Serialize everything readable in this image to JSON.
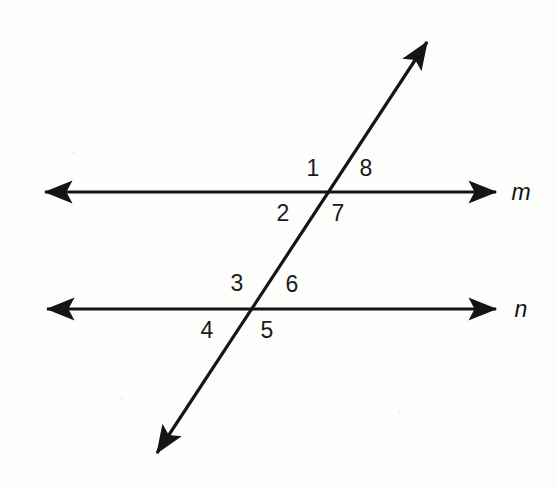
{
  "canvas": {
    "width": 556,
    "height": 491,
    "background_color": "#fdfdfc",
    "stroke_color": "#151515"
  },
  "diagram": {
    "type": "parallel-lines-cut-by-transversal",
    "lines": [
      {
        "name": "line-m",
        "label": "m",
        "orientation": "horizontal",
        "double_arrow": true,
        "x1": 35,
        "y1": 192,
        "x2": 505,
        "y2": 192,
        "label_x": 521,
        "label_y": 192
      },
      {
        "name": "line-n",
        "label": "n",
        "orientation": "horizontal",
        "double_arrow": true,
        "x1": 37,
        "y1": 309,
        "x2": 505,
        "y2": 309,
        "label_x": 521,
        "label_y": 309
      },
      {
        "name": "transversal",
        "label": "",
        "orientation": "diagonal",
        "double_arrow": true,
        "x1": 150,
        "y1": 464,
        "x2": 434,
        "y2": 32,
        "label_x": null,
        "label_y": null
      }
    ],
    "intersections": [
      {
        "name": "intersection-m",
        "x": 332,
        "y": 192
      },
      {
        "name": "intersection-n",
        "x": 252,
        "y": 309
      }
    ],
    "angle_labels": [
      {
        "text": "1",
        "x": 313,
        "y": 168,
        "position": "upper-left-at-m"
      },
      {
        "text": "8",
        "x": 366,
        "y": 168,
        "position": "upper-right-at-m"
      },
      {
        "text": "2",
        "x": 283,
        "y": 213,
        "position": "lower-left-at-m"
      },
      {
        "text": "7",
        "x": 338,
        "y": 213,
        "position": "lower-right-at-m"
      },
      {
        "text": "3",
        "x": 237,
        "y": 283,
        "position": "upper-left-at-n"
      },
      {
        "text": "6",
        "x": 292,
        "y": 284,
        "position": "upper-right-at-n"
      },
      {
        "text": "4",
        "x": 207,
        "y": 330,
        "position": "lower-left-at-n"
      },
      {
        "text": "5",
        "x": 267,
        "y": 330,
        "position": "lower-right-at-n"
      }
    ]
  }
}
